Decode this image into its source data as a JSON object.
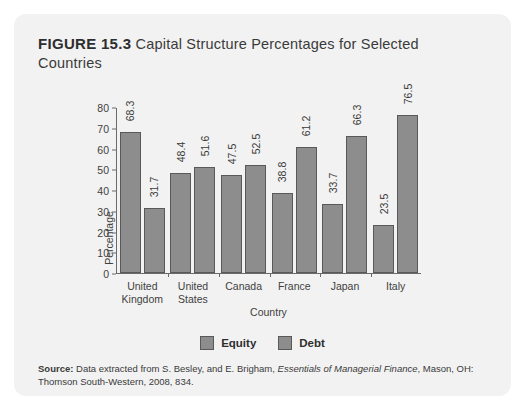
{
  "figure": {
    "label": "FIGURE 15.3",
    "caption": "Capital Structure Percentages for Selected Countries"
  },
  "source": {
    "label": "Source:",
    "text_before": " Data extracted from S. Besley, and E. Brigham, ",
    "italic_title": "Essentials of Managerial Finance",
    "text_after": ", Mason, OH: Thomson South-Western, 2008, 834."
  },
  "chart_data": {
    "type": "bar",
    "title": "Capital Structure Percentages for Selected Countries",
    "xlabel": "Country",
    "ylabel": "Percentage",
    "categories": [
      "United Kingdom",
      "United States",
      "Canada",
      "France",
      "Japan",
      "Italy"
    ],
    "category_lines": [
      [
        "United",
        "Kingdom"
      ],
      [
        "United",
        "States"
      ],
      [
        "Canada"
      ],
      [
        "France"
      ],
      [
        "Japan"
      ],
      [
        "Italy"
      ]
    ],
    "series": [
      {
        "name": "Equity",
        "values": [
          68.3,
          48.4,
          47.5,
          38.8,
          33.7,
          23.5
        ]
      },
      {
        "name": "Debt",
        "values": [
          31.7,
          51.6,
          52.5,
          61.2,
          66.3,
          76.5
        ]
      }
    ],
    "ylim": [
      0,
      80
    ],
    "yticks": [
      80,
      70,
      60,
      50,
      40,
      30,
      20,
      10,
      0
    ],
    "grid": false,
    "legend_position": "bottom",
    "bar_color": "#8d8d8d",
    "bar_border_color": "#595959"
  },
  "colors": {
    "card_background": "#f2f2f2",
    "page_background": "#ffffff",
    "axis": "#6a6a6a",
    "text": "#3a3a3a"
  }
}
